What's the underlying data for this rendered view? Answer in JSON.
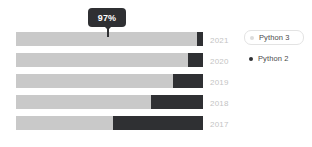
{
  "chart_data": {
    "type": "bar",
    "title": "",
    "subtitle": "",
    "xlabel": "",
    "ylabel": "",
    "orientation": "horizontal",
    "stacked": true,
    "normalized_percent": true,
    "grid": false,
    "xlim": [
      0,
      100
    ],
    "categories": [
      "2021",
      "2020",
      "2019",
      "2018",
      "2017"
    ],
    "series": [
      {
        "name": "Python 3",
        "color": "#c9c9c9",
        "values": [
          97,
          92,
          84,
          72,
          52
        ]
      },
      {
        "name": "Python 2",
        "color": "#2f3033",
        "values": [
          3,
          8,
          16,
          28,
          48
        ]
      }
    ],
    "legend": {
      "position": "right",
      "entries": [
        {
          "label": "Python 3",
          "color": "#dcdcdc",
          "highlighted": true
        },
        {
          "label": "Python 2",
          "color": "#2f3033",
          "highlighted": false
        }
      ]
    },
    "annotations": [
      {
        "type": "tooltip",
        "text": "97%",
        "category": "2021",
        "series": "Python 3"
      }
    ]
  },
  "tooltip": {
    "value": "97%"
  },
  "axis": {
    "category_labels": [
      "2021",
      "2020",
      "2019",
      "2018",
      "2017"
    ],
    "label_color": "#c4c4c4"
  },
  "legend": {
    "items": [
      {
        "label": "Python 3",
        "dot_color": "#dcdcdc"
      },
      {
        "label": "Python 2",
        "dot_color": "#2f3033"
      }
    ]
  },
  "colors": {
    "python3": "#c9c9c9",
    "python2": "#2f3033",
    "background": "#ffffff",
    "tooltip_bg": "#2f3033",
    "legend_border": "#e3e3e3"
  }
}
